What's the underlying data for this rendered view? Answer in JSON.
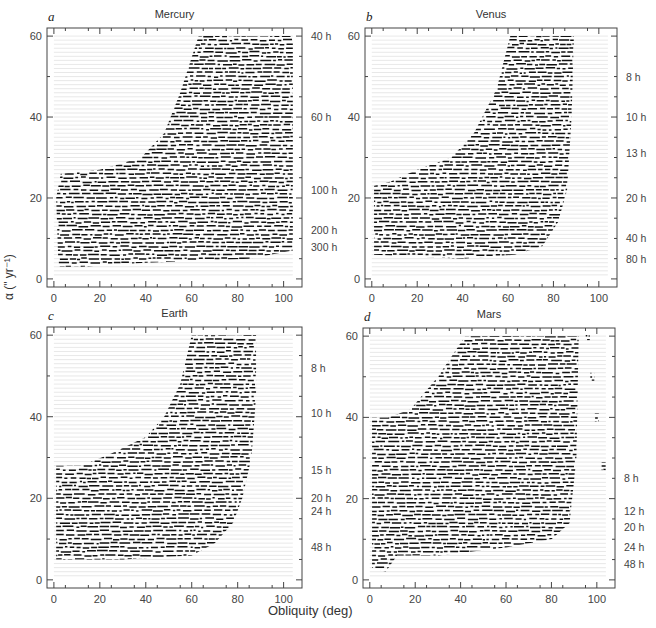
{
  "figure": {
    "xlabel": "Obliquity (deg)",
    "ylabel": "α (\" yr⁻¹)"
  },
  "chart_data": [
    {
      "type": "scatter",
      "panel_letter": "a",
      "title": "Mercury",
      "xlabel": "Obliquity (deg)",
      "ylabel": "α (\" yr⁻¹)",
      "xlim": [
        -3,
        108
      ],
      "ylim": [
        -2,
        62
      ],
      "xticks": [
        0,
        20,
        40,
        60,
        80,
        100
      ],
      "yticks": [
        0,
        20,
        40,
        60
      ],
      "x_data_range": [
        0,
        104
      ],
      "right_labels": [
        {
          "text": "40 h",
          "alpha": 60
        },
        {
          "text": "60 h",
          "alpha": 40
        },
        {
          "text": "100 h",
          "alpha": 22
        },
        {
          "text": "200 h",
          "alpha": 12
        },
        {
          "text": "300 h",
          "alpha": 8
        }
      ],
      "chaotic_region": [
        [
          2,
          3
        ],
        [
          12,
          3
        ],
        [
          40,
          4
        ],
        [
          85,
          5
        ],
        [
          104,
          7
        ],
        [
          104,
          60
        ],
        [
          63,
          60
        ],
        [
          55,
          46
        ],
        [
          48,
          36
        ],
        [
          38,
          30
        ],
        [
          20,
          27
        ],
        [
          3,
          26
        ],
        [
          1,
          20
        ]
      ]
    },
    {
      "type": "scatter",
      "panel_letter": "b",
      "title": "Venus",
      "xlabel": "Obliquity (deg)",
      "ylabel": "α (\" yr⁻¹)",
      "xlim": [
        -3,
        108
      ],
      "ylim": [
        -2,
        62
      ],
      "xticks": [
        0,
        20,
        40,
        60,
        80,
        100
      ],
      "yticks": [
        0,
        20,
        40,
        60
      ],
      "x_data_range": [
        0,
        104
      ],
      "right_labels": [
        {
          "text": "8 h",
          "alpha": 50
        },
        {
          "text": "10 h",
          "alpha": 40
        },
        {
          "text": "13 h",
          "alpha": 31
        },
        {
          "text": "20 h",
          "alpha": 20
        },
        {
          "text": "40 h",
          "alpha": 10
        },
        {
          "text": "80 h",
          "alpha": 5
        }
      ],
      "chaotic_region": [
        [
          1,
          6
        ],
        [
          40,
          5
        ],
        [
          63,
          6
        ],
        [
          75,
          8
        ],
        [
          82,
          14
        ],
        [
          86,
          22
        ],
        [
          88,
          40
        ],
        [
          89,
          60
        ],
        [
          61,
          60
        ],
        [
          55,
          47
        ],
        [
          45,
          36
        ],
        [
          35,
          30
        ],
        [
          20,
          27
        ],
        [
          8,
          24
        ],
        [
          1,
          23
        ]
      ]
    },
    {
      "type": "scatter",
      "panel_letter": "c",
      "title": "Earth",
      "xlabel": "Obliquity (deg)",
      "ylabel": "α (\" yr⁻¹)",
      "xlim": [
        -3,
        108
      ],
      "ylim": [
        -2,
        62
      ],
      "xticks": [
        0,
        20,
        40,
        60,
        80,
        100
      ],
      "yticks": [
        0,
        20,
        40,
        60
      ],
      "x_data_range": [
        0,
        104
      ],
      "right_labels": [
        {
          "text": "8 h",
          "alpha": 52
        },
        {
          "text": "10 h",
          "alpha": 41
        },
        {
          "text": "15 h",
          "alpha": 27
        },
        {
          "text": "20 h",
          "alpha": 20
        },
        {
          "text": "24 h",
          "alpha": 17
        },
        {
          "text": "48 h",
          "alpha": 8
        }
      ],
      "chaotic_region": [
        [
          1,
          5
        ],
        [
          30,
          5
        ],
        [
          60,
          6
        ],
        [
          70,
          9
        ],
        [
          78,
          14
        ],
        [
          82,
          20
        ],
        [
          86,
          30
        ],
        [
          88,
          45
        ],
        [
          88,
          60
        ],
        [
          60,
          60
        ],
        [
          55,
          48
        ],
        [
          48,
          40
        ],
        [
          40,
          35
        ],
        [
          25,
          31
        ],
        [
          12,
          28
        ],
        [
          1,
          28
        ]
      ]
    },
    {
      "type": "scatter",
      "panel_letter": "d",
      "title": "Mars",
      "xlabel": "Obliquity (deg)",
      "ylabel": "α (\" yr⁻¹)",
      "xlim": [
        -3,
        108
      ],
      "ylim": [
        -2,
        62
      ],
      "xticks": [
        0,
        20,
        40,
        60,
        80,
        100
      ],
      "yticks": [
        0,
        20,
        40,
        60
      ],
      "x_data_range": [
        0,
        104
      ],
      "right_labels": [
        {
          "text": "8 h",
          "alpha": 25
        },
        {
          "text": "12 h",
          "alpha": 17
        },
        {
          "text": "20 h",
          "alpha": 13
        },
        {
          "text": "24 h",
          "alpha": 8
        },
        {
          "text": "48 h",
          "alpha": 4
        }
      ],
      "chaotic_region": [
        [
          1,
          3
        ],
        [
          7,
          2
        ],
        [
          12,
          6
        ],
        [
          30,
          6
        ],
        [
          60,
          8
        ],
        [
          80,
          10
        ],
        [
          88,
          14
        ],
        [
          91,
          30
        ],
        [
          92,
          60
        ],
        [
          42,
          60
        ],
        [
          30,
          50
        ],
        [
          18,
          42
        ],
        [
          8,
          40
        ],
        [
          1,
          40
        ]
      ],
      "secondary_branch": [
        [
          96,
          60
        ],
        [
          98,
          50
        ],
        [
          100,
          40
        ],
        [
          103,
          28
        ]
      ]
    }
  ]
}
